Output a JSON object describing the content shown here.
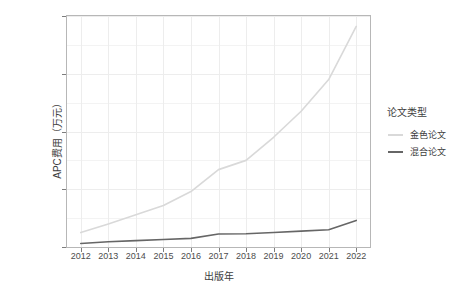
{
  "chart_data": {
    "type": "line",
    "title": "",
    "xlabel": "出版年",
    "ylabel": "APC费用（万元）",
    "x": [
      2012,
      2013,
      2014,
      2015,
      2016,
      2017,
      2018,
      2019,
      2020,
      2021,
      2022
    ],
    "xtick_labels": [
      "2012",
      "2013",
      "2014",
      "2015",
      "2016",
      "2017",
      "2018",
      "2019",
      "2020",
      "2021",
      "2022"
    ],
    "ytick_labels": [
      "0",
      "1000",
      "2000",
      "3000",
      "4000"
    ],
    "ytick_values": [
      0,
      1000,
      2000,
      3000,
      4000
    ],
    "xlim": [
      2011.5,
      2022.5
    ],
    "ylim": [
      0,
      4000
    ],
    "grid": true,
    "legend_position": "right",
    "legend_title": "论文类型",
    "series": [
      {
        "name": "金色论文",
        "color": "#d9d9d9",
        "values": [
          250,
          400,
          560,
          720,
          960,
          1340,
          1500,
          1900,
          2350,
          2900,
          3820
        ]
      },
      {
        "name": "混合论文",
        "color": "#666666",
        "values": [
          60,
          90,
          110,
          130,
          150,
          225,
          230,
          250,
          275,
          300,
          460
        ]
      }
    ]
  },
  "axes": {
    "y_title": "APC费用（万元）",
    "x_title": "出版年"
  },
  "legend": {
    "title": "论文类型",
    "items": [
      {
        "label": "金色论文",
        "color": "#d9d9d9"
      },
      {
        "label": "混合论文",
        "color": "#666666"
      }
    ]
  },
  "colors": {
    "panel_border": "#b7b7b7",
    "grid": "#f1f1f1",
    "text": "#4d4d4d",
    "background": "#ffffff"
  }
}
